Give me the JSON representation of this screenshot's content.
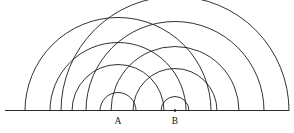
{
  "figure": {
    "background_color": "#ffffff",
    "stroke_color": "#1c1c1c",
    "baseline_color": "#2b2b2b",
    "baseline": {
      "y": 110.5,
      "x_start": 5,
      "x_end": 289
    },
    "centers": [
      {
        "id": "A",
        "label": "A",
        "x": 118,
        "y": 110.5,
        "label_x": 118,
        "label_y": 124,
        "dot_visible": false,
        "radii": [
          18,
          46,
          68,
          93
        ]
      },
      {
        "id": "B",
        "label": "B",
        "x": 175,
        "y": 110.5,
        "label_x": 175,
        "label_y": 124,
        "dot_visible": true,
        "radii": [
          14,
          42,
          64,
          89,
          114
        ]
      }
    ],
    "arc_count": 9,
    "labels": {
      "a": "A",
      "b": "B"
    }
  }
}
